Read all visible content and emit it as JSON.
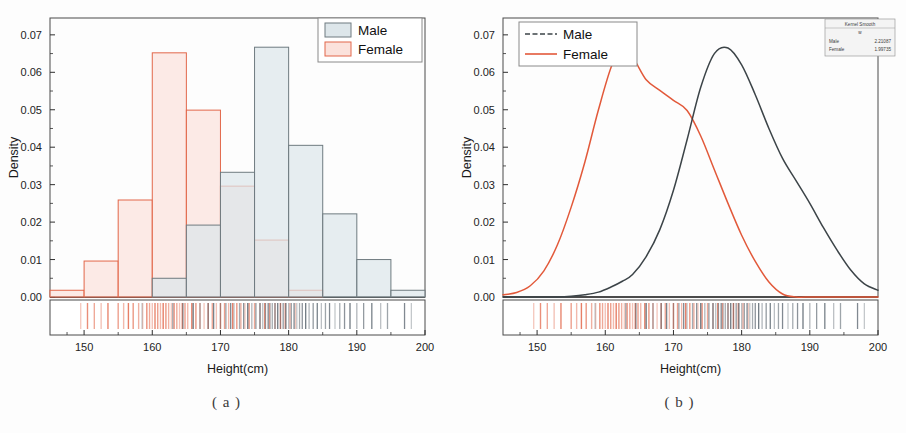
{
  "figure": {
    "caption_a": "( a )",
    "caption_b": "( b )"
  },
  "colors": {
    "male_fill": "#dde6ea",
    "male_line": "#6f7b80",
    "male_curve": "#3c4448",
    "female_fill": "#fbe2dc",
    "female_line": "#e2674a",
    "female_curve": "#e2593a",
    "axis": "#2e2e2e",
    "frame": "#4a4a4a",
    "background": "#fdfdfd"
  },
  "panel_a": {
    "name": "histogram-panel",
    "legend": {
      "items": [
        {
          "label": "Male",
          "swatch": "male"
        },
        {
          "label": "Female",
          "swatch": "female"
        }
      ]
    },
    "xlabel": "Height(cm)",
    "ylabel": "Density",
    "xticks": [
      "150",
      "160",
      "170",
      "180",
      "190",
      "200"
    ],
    "yticks": [
      "0.00",
      "0.01",
      "0.02",
      "0.03",
      "0.04",
      "0.05",
      "0.06",
      "0.07"
    ]
  },
  "panel_b": {
    "name": "kernel-density-panel",
    "legend": {
      "items": [
        {
          "label": "Male",
          "style": "dashed"
        },
        {
          "label": "Female",
          "style": "solid"
        }
      ]
    },
    "info_box": {
      "title": "Kernel Smooth",
      "subtitle": "w",
      "rows": [
        {
          "label": "Male",
          "value": "2.21087"
        },
        {
          "label": "Female",
          "value": "1.99735"
        }
      ]
    },
    "xlabel": "Height(cm)",
    "ylabel": "Density",
    "xticks": [
      "150",
      "160",
      "170",
      "180",
      "190",
      "200"
    ],
    "yticks": [
      "0.00",
      "0.01",
      "0.02",
      "0.03",
      "0.04",
      "0.05",
      "0.06",
      "0.07"
    ]
  },
  "chart_data": [
    {
      "type": "bar",
      "id": "panel-a-histogram",
      "title": "",
      "subtitle": "( a )",
      "xlabel": "Height(cm)",
      "ylabel": "Density",
      "xlim": [
        145,
        200
      ],
      "ylim": [
        0.0,
        0.0745
      ],
      "grid": false,
      "legend_position": "top-right",
      "bin_width": 5,
      "bin_edges": [
        145,
        150,
        155,
        160,
        165,
        170,
        175,
        180,
        185,
        190,
        195,
        200
      ],
      "categories": [
        "145-150",
        "150-155",
        "155-160",
        "160-165",
        "165-170",
        "170-175",
        "175-180",
        "180-185",
        "185-190",
        "190-195",
        "195-200"
      ],
      "series": [
        {
          "name": "Male",
          "fill": "#dde6ea",
          "edge": "#6f7b80",
          "values": [
            0.0,
            0.0,
            0.0,
            0.005,
            0.0192,
            0.0333,
            0.0667,
            0.0405,
            0.0222,
            0.01,
            0.0018
          ]
        },
        {
          "name": "Female",
          "fill": "#fbe2dc",
          "edge": "#e2674a",
          "values": [
            0.0018,
            0.0096,
            0.0259,
            0.0652,
            0.0499,
            0.0296,
            0.0152,
            0.0018,
            0.0,
            0.0,
            0.0
          ]
        }
      ],
      "rug": {
        "male": [
          158.5,
          163.0,
          164.5,
          166.0,
          167.0,
          168.2,
          169.0,
          170.0,
          170.8,
          171.5,
          172.0,
          172.8,
          173.4,
          174.0,
          174.6,
          175.2,
          175.8,
          176.2,
          176.6,
          177.0,
          177.3,
          177.6,
          178.0,
          178.4,
          178.8,
          179.2,
          179.6,
          180.0,
          180.4,
          180.8,
          181.2,
          181.6,
          182.0,
          182.5,
          183.0,
          183.6,
          184.2,
          184.8,
          185.4,
          186.0,
          186.8,
          187.5,
          188.2,
          189.0,
          190.0,
          191.0,
          192.2,
          193.5,
          194.5,
          197.0,
          198.0
        ],
        "female": [
          149.5,
          150.5,
          151.5,
          152.5,
          153.5,
          155.0,
          155.8,
          156.5,
          157.2,
          158.0,
          158.6,
          159.2,
          159.6,
          160.0,
          160.4,
          160.8,
          161.2,
          161.6,
          162.0,
          162.4,
          162.8,
          163.2,
          163.6,
          164.0,
          164.4,
          164.8,
          165.2,
          165.8,
          166.4,
          167.0,
          167.6,
          168.2,
          168.8,
          169.4,
          170.0,
          170.6,
          171.2,
          171.8,
          172.4,
          173.0,
          173.6,
          174.2,
          175.0,
          175.8,
          176.5,
          177.2,
          178.0,
          178.8,
          179.5,
          180.2,
          181.0
        ]
      }
    },
    {
      "type": "line",
      "id": "panel-b-kernel-density",
      "title": "",
      "subtitle": "( b )",
      "xlabel": "Height(cm)",
      "ylabel": "Density",
      "xlim": [
        145,
        200
      ],
      "ylim": [
        0.0,
        0.0745
      ],
      "grid": false,
      "legend_position": "top-left",
      "annotation": "Kernel Smooth w: Male 2.21087, Female 1.99735",
      "x": [
        145,
        147,
        149,
        151,
        153,
        155,
        157,
        159,
        161,
        162.5,
        164,
        166,
        168,
        170,
        172,
        174,
        176,
        178,
        180,
        182,
        184,
        186,
        188,
        190,
        192,
        194,
        196,
        198,
        200
      ],
      "series": [
        {
          "name": "Male",
          "color": "#3c4448",
          "values": [
            0.0,
            0.0,
            0.0,
            0.0,
            0.0,
            0.0002,
            0.0006,
            0.0013,
            0.0028,
            0.0042,
            0.006,
            0.0108,
            0.018,
            0.0285,
            0.042,
            0.056,
            0.065,
            0.0665,
            0.062,
            0.054,
            0.045,
            0.037,
            0.031,
            0.025,
            0.0185,
            0.0125,
            0.0072,
            0.0035,
            0.0018
          ]
        },
        {
          "name": "Female",
          "color": "#e2593a",
          "values": [
            0.0006,
            0.0012,
            0.003,
            0.007,
            0.014,
            0.024,
            0.036,
            0.05,
            0.062,
            0.0652,
            0.064,
            0.058,
            0.0552,
            0.0525,
            0.0498,
            0.043,
            0.034,
            0.025,
            0.0165,
            0.0095,
            0.004,
            0.0008,
            0.0,
            0.0,
            0.0,
            0.0,
            0.0,
            0.0,
            0.0
          ]
        }
      ],
      "rug": {
        "male": [
          158.5,
          163.0,
          164.5,
          166.0,
          167.0,
          168.2,
          169.0,
          170.0,
          170.8,
          171.5,
          172.0,
          172.8,
          173.4,
          174.0,
          174.6,
          175.2,
          175.8,
          176.2,
          176.6,
          177.0,
          177.3,
          177.6,
          178.0,
          178.4,
          178.8,
          179.2,
          179.6,
          180.0,
          180.4,
          180.8,
          181.2,
          181.6,
          182.0,
          182.5,
          183.0,
          183.6,
          184.2,
          184.8,
          185.4,
          186.0,
          186.8,
          187.5,
          188.2,
          189.0,
          190.0,
          191.0,
          192.2,
          193.5,
          194.5,
          197.0,
          198.0
        ],
        "female": [
          149.5,
          150.5,
          151.5,
          152.5,
          153.5,
          155.0,
          155.8,
          156.5,
          157.2,
          158.0,
          158.6,
          159.2,
          159.6,
          160.0,
          160.4,
          160.8,
          161.2,
          161.6,
          162.0,
          162.4,
          162.8,
          163.2,
          163.6,
          164.0,
          164.4,
          164.8,
          165.2,
          165.8,
          166.4,
          167.0,
          167.6,
          168.2,
          168.8,
          169.4,
          170.0,
          170.6,
          171.2,
          171.8,
          172.4,
          173.0,
          173.6,
          174.2,
          175.0,
          175.8,
          176.5,
          177.2,
          178.0,
          178.8,
          179.5,
          180.2,
          181.0
        ]
      }
    }
  ]
}
